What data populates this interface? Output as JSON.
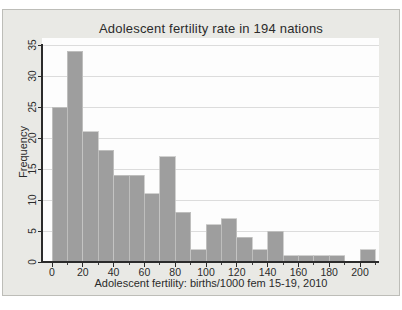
{
  "chart_data": {
    "type": "bar",
    "subtype": "histogram",
    "title": "Adolescent fertility rate in 194 nations",
    "xlabel": "Adolescent fertility: births/1000 fem 15-19, 2010",
    "ylabel": "Frequency",
    "n_total": 194,
    "bin_width": 10,
    "bin_edges": [
      0,
      10,
      20,
      30,
      40,
      50,
      60,
      70,
      80,
      90,
      100,
      110,
      120,
      130,
      140,
      150,
      160,
      170,
      180,
      190,
      200,
      210
    ],
    "values": [
      25,
      34,
      21,
      18,
      14,
      14,
      11,
      17,
      8,
      2,
      6,
      7,
      4,
      2,
      5,
      1,
      1,
      1,
      1,
      0,
      2
    ],
    "x_ticks": [
      0,
      20,
      40,
      60,
      80,
      100,
      120,
      140,
      160,
      180,
      200
    ],
    "x_minor_ticks": [
      10,
      30,
      50,
      70,
      90,
      110,
      130,
      150,
      170,
      190,
      210
    ],
    "y_ticks": [
      0,
      5,
      10,
      15,
      20,
      25,
      30,
      35
    ],
    "ylim": [
      0,
      35
    ],
    "xlim": [
      -6.5,
      212
    ],
    "grid": true,
    "legend": null
  },
  "colors": {
    "page_bg": "#ffffff",
    "figure_bg": "#e9e9e5",
    "figure_border": "#bdbdb8",
    "plot_bg": "#fdfdfd",
    "grid": "#dcdcdc",
    "bar_fill": "#9e9e9e",
    "bar_edge": "#c6c6c4",
    "axis": "#2b2b2b",
    "text": "#2b2b2b"
  }
}
